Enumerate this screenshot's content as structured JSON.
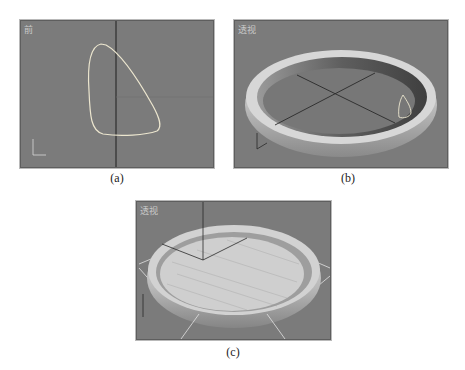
{
  "figure": {
    "panels": [
      {
        "id": "a",
        "viewport_label": "前",
        "caption": "(a)",
        "content": "front viewport with closed spline curve (teardrop profile)"
      },
      {
        "id": "b",
        "viewport_label": "透视",
        "caption": "(b)",
        "content": "perspective viewport showing lathed dish shell with profile spline"
      },
      {
        "id": "c",
        "viewport_label": "透视",
        "caption": "(c)",
        "content": "perspective viewport showing dish with light-colored inner plate and gizmo"
      }
    ]
  },
  "colors": {
    "viewport_bg": "#7b7b7b",
    "spline": "#e8e8e8",
    "grid_axis": "#2a2a2a",
    "dish_light": "#d8d8d8",
    "dish_dark": "#6a6a6a",
    "plate_fill": "#c8c8c8"
  }
}
